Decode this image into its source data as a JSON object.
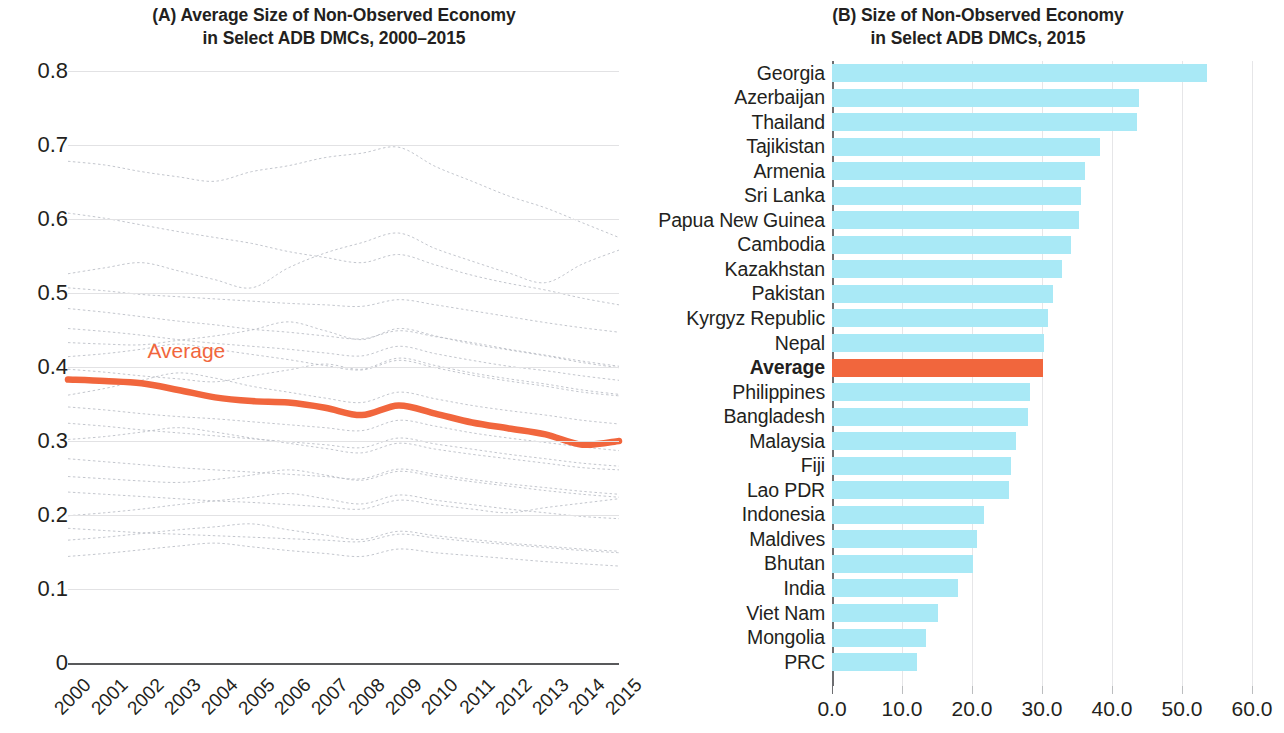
{
  "panel_a": {
    "title": "(A) Average Size of Non-Observed Economy\nin Select ADB DMCs, 2000–2015",
    "average_series_label": "Average",
    "accent_color": "#f1663d",
    "faint_color": "#b9bcc4"
  },
  "panel_b": {
    "title": "(B) Size of Non-Observed Economy\nin Select ADB DMCs, 2015",
    "bar_color": "#a9e9f6",
    "average_bar_color": "#f1663d"
  },
  "chart_data": [
    {
      "type": "line",
      "panel": "A",
      "title": "(A) Average Size of Non-Observed Economy in Select ADB DMCs, 2000–2015",
      "xlabel": "",
      "ylabel": "",
      "grid": true,
      "legend": "inline-annotation",
      "ylim": [
        0,
        0.8
      ],
      "yticks": [
        "0",
        "0.1",
        "0.2",
        "0.3",
        "0.4",
        "0.5",
        "0.6",
        "0.7",
        "0.8"
      ],
      "x": [
        2000,
        2001,
        2002,
        2003,
        2004,
        2005,
        2006,
        2007,
        2008,
        2009,
        2010,
        2011,
        2012,
        2013,
        2014,
        2015
      ],
      "xticklabels": [
        "2000",
        "2001",
        "2002",
        "2003",
        "2004",
        "2005",
        "2006",
        "2007",
        "2008",
        "2009",
        "2010",
        "2011",
        "2012",
        "2013",
        "2014",
        "2015"
      ],
      "series": [
        {
          "name": "Average",
          "highlight": true,
          "values": [
            0.383,
            0.381,
            0.378,
            0.369,
            0.359,
            0.354,
            0.352,
            0.345,
            0.335,
            0.348,
            0.337,
            0.325,
            0.317,
            0.309,
            0.295,
            0.3
          ]
        },
        {
          "name": "background-country-1",
          "highlight": false,
          "values": [
            0.678,
            0.673,
            0.664,
            0.657,
            0.651,
            0.664,
            0.672,
            0.683,
            0.689,
            0.697,
            0.671,
            0.651,
            0.631,
            0.615,
            0.595,
            0.575
          ]
        },
        {
          "name": "background-country-2",
          "highlight": false,
          "values": [
            0.608,
            0.601,
            0.592,
            0.583,
            0.575,
            0.567,
            0.556,
            0.548,
            0.541,
            0.552,
            0.538,
            0.524,
            0.513,
            0.504,
            0.493,
            0.484
          ]
        },
        {
          "name": "background-country-3",
          "highlight": false,
          "values": [
            0.526,
            0.534,
            0.541,
            0.53,
            0.518,
            0.507,
            0.534,
            0.554,
            0.568,
            0.581,
            0.56,
            0.543,
            0.527,
            0.514,
            0.539,
            0.558
          ]
        },
        {
          "name": "background-country-4",
          "highlight": false,
          "values": [
            0.507,
            0.503,
            0.498,
            0.495,
            0.492,
            0.489,
            0.486,
            0.484,
            0.482,
            0.491,
            0.484,
            0.476,
            0.468,
            0.46,
            0.453,
            0.447
          ]
        },
        {
          "name": "background-country-5",
          "highlight": false,
          "values": [
            0.479,
            0.474,
            0.468,
            0.462,
            0.457,
            0.451,
            0.447,
            0.442,
            0.438,
            0.449,
            0.441,
            0.433,
            0.424,
            0.416,
            0.408,
            0.401
          ]
        },
        {
          "name": "background-country-6",
          "highlight": false,
          "values": [
            0.452,
            0.448,
            0.443,
            0.437,
            0.432,
            0.428,
            0.424,
            0.419,
            0.415,
            0.428,
            0.418,
            0.409,
            0.401,
            0.395,
            0.388,
            0.382
          ]
        },
        {
          "name": "background-country-7",
          "highlight": false,
          "values": [
            0.433,
            0.431,
            0.43,
            0.436,
            0.442,
            0.45,
            0.461,
            0.449,
            0.437,
            0.452,
            0.442,
            0.431,
            0.423,
            0.415,
            0.406,
            0.399
          ]
        },
        {
          "name": "background-country-8",
          "highlight": false,
          "values": [
            0.414,
            0.418,
            0.424,
            0.431,
            0.424,
            0.417,
            0.41,
            0.402,
            0.396,
            0.409,
            0.399,
            0.389,
            0.381,
            0.374,
            0.366,
            0.361
          ]
        },
        {
          "name": "background-country-9",
          "highlight": false,
          "values": [
            0.397,
            0.393,
            0.388,
            0.384,
            0.38,
            0.388,
            0.396,
            0.404,
            0.397,
            0.412,
            0.402,
            0.392,
            0.384,
            0.377,
            0.369,
            0.363
          ]
        },
        {
          "name": "background-country-10",
          "highlight": false,
          "values": [
            0.362,
            0.371,
            0.382,
            0.392,
            0.385,
            0.374,
            0.366,
            0.358,
            0.352,
            0.366,
            0.357,
            0.348,
            0.341,
            0.335,
            0.328,
            0.323
          ]
        },
        {
          "name": "background-country-11",
          "highlight": false,
          "values": [
            0.346,
            0.342,
            0.337,
            0.333,
            0.33,
            0.326,
            0.322,
            0.318,
            0.314,
            0.328,
            0.32,
            0.311,
            0.304,
            0.298,
            0.292,
            0.287
          ]
        },
        {
          "name": "background-country-12",
          "highlight": false,
          "values": [
            0.324,
            0.32,
            0.315,
            0.311,
            0.307,
            0.303,
            0.299,
            0.295,
            0.291,
            0.304,
            0.296,
            0.289,
            0.282,
            0.276,
            0.27,
            0.266
          ]
        },
        {
          "name": "background-country-13",
          "highlight": false,
          "values": [
            0.302,
            0.306,
            0.312,
            0.318,
            0.312,
            0.304,
            0.297,
            0.29,
            0.284,
            0.297,
            0.289,
            0.282,
            0.276,
            0.27,
            0.264,
            0.261
          ]
        },
        {
          "name": "background-country-14",
          "highlight": false,
          "values": [
            0.276,
            0.272,
            0.268,
            0.264,
            0.261,
            0.258,
            0.255,
            0.252,
            0.249,
            0.262,
            0.255,
            0.248,
            0.242,
            0.237,
            0.232,
            0.228
          ]
        },
        {
          "name": "background-country-15",
          "highlight": false,
          "values": [
            0.252,
            0.249,
            0.246,
            0.244,
            0.248,
            0.254,
            0.261,
            0.254,
            0.247,
            0.259,
            0.252,
            0.245,
            0.239,
            0.233,
            0.228,
            0.224
          ]
        },
        {
          "name": "background-country-16",
          "highlight": false,
          "values": [
            0.231,
            0.228,
            0.225,
            0.222,
            0.219,
            0.217,
            0.214,
            0.211,
            0.208,
            0.22,
            0.214,
            0.208,
            0.203,
            0.21,
            0.216,
            0.222
          ]
        },
        {
          "name": "background-country-17",
          "highlight": false,
          "values": [
            0.199,
            0.203,
            0.208,
            0.214,
            0.219,
            0.224,
            0.229,
            0.222,
            0.215,
            0.227,
            0.22,
            0.214,
            0.208,
            0.203,
            0.198,
            0.195
          ]
        },
        {
          "name": "background-country-18",
          "highlight": false,
          "values": [
            0.182,
            0.179,
            0.176,
            0.174,
            0.172,
            0.17,
            0.168,
            0.166,
            0.164,
            0.174,
            0.169,
            0.164,
            0.16,
            0.156,
            0.152,
            0.149
          ]
        },
        {
          "name": "background-country-19",
          "highlight": false,
          "values": [
            0.166,
            0.17,
            0.175,
            0.18,
            0.184,
            0.188,
            0.18,
            0.173,
            0.167,
            0.178,
            0.172,
            0.167,
            0.162,
            0.158,
            0.154,
            0.151
          ]
        },
        {
          "name": "background-country-20",
          "highlight": false,
          "values": [
            0.144,
            0.148,
            0.153,
            0.158,
            0.162,
            0.157,
            0.152,
            0.148,
            0.144,
            0.154,
            0.149,
            0.145,
            0.141,
            0.137,
            0.134,
            0.131
          ]
        }
      ]
    },
    {
      "type": "bar",
      "panel": "B",
      "orientation": "horizontal",
      "title": "(B) Size of Non-Observed Economy in Select ADB DMCs, 2015",
      "xlabel": "",
      "ylabel": "",
      "grid": true,
      "xlim": [
        0,
        60
      ],
      "xticks": [
        0,
        10,
        20,
        30,
        40,
        50,
        60
      ],
      "xticklabels": [
        "0.0",
        "10.0",
        "20.0",
        "30.0",
        "40.0",
        "50.0",
        "60.0"
      ],
      "categories": [
        "Georgia",
        "Azerbaijan",
        "Thailand",
        "Tajikistan",
        "Armenia",
        "Sri Lanka",
        "Papua New Guinea",
        "Cambodia",
        "Kazakhstan",
        "Pakistan",
        "Kyrgyz Republic",
        "Nepal",
        "Average",
        "Philippines",
        "Bangladesh",
        "Malaysia",
        "Fiji",
        "Lao PDR",
        "Indonesia",
        "Maldives",
        "Bhutan",
        "India",
        "Viet Nam",
        "Mongolia",
        "PRC"
      ],
      "values": [
        53.6,
        43.9,
        43.6,
        38.3,
        36.1,
        35.6,
        35.3,
        34.1,
        32.8,
        31.6,
        30.8,
        30.3,
        30.1,
        28.3,
        28.0,
        26.3,
        25.6,
        25.3,
        21.7,
        20.7,
        20.1,
        18.0,
        15.1,
        13.4,
        12.1
      ],
      "highlight_category": "Average"
    }
  ]
}
